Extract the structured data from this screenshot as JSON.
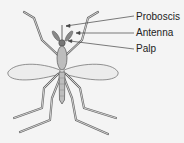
{
  "diagram": {
    "labels": [
      {
        "text": "Proboscis",
        "x": 136,
        "y": 11
      },
      {
        "text": "Antenna",
        "x": 136,
        "y": 27
      },
      {
        "text": "Palp",
        "x": 136,
        "y": 43
      }
    ],
    "colors": {
      "body": "#bdbdbd",
      "outline": "#555555",
      "wing": "#ececec",
      "leader": "#444444",
      "background": "#f4f4f4"
    }
  }
}
